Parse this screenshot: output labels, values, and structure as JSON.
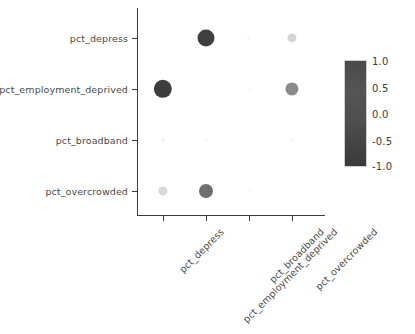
{
  "chart_data": {
    "type": "heatmap",
    "title": "",
    "xlabel": "",
    "ylabel": "",
    "grid": false,
    "legend_position": "right",
    "categories": [
      "pct_depress",
      "pct_employment_deprived",
      "pct_broadband",
      "pct_overcrowded"
    ],
    "x_tick_labels": [
      "pct_depress",
      "pct_employment_deprived",
      "pct_broadband",
      "pct_overcrowded"
    ],
    "y_tick_labels": [
      "pct_depress",
      "pct_employment_deprived",
      "pct_broadband",
      "pct_overcrowded"
    ],
    "colorbar": {
      "ticks": [
        "1.0",
        "0.5",
        "0.0",
        "-0.5",
        "-1.0"
      ],
      "vmin": -1.0,
      "vmax": 1.0,
      "top_color": "#4a4a4a",
      "bottom_color": "#3a3a3a"
    },
    "note": "Correlation matrix rendered as size+shade encoded dots; diagonal self-correlations not drawn.",
    "matrix": [
      {
        "row": "pct_depress",
        "cells": [
          {
            "col": "pct_depress",
            "value": null,
            "radius": 0.0,
            "color": "#ffffff"
          },
          {
            "col": "pct_employment_deprived",
            "value": 0.7,
            "radius": 8.5,
            "color": "#3f3f3f"
          },
          {
            "col": "pct_broadband",
            "value": 0.04,
            "radius": 1.6,
            "color": "#f4f4f4"
          },
          {
            "col": "pct_overcrowded",
            "value": 0.22,
            "radius": 4.6,
            "color": "#d5d5d5"
          }
        ]
      },
      {
        "row": "pct_employment_deprived",
        "cells": [
          {
            "col": "pct_depress",
            "value": 0.7,
            "radius": 9.2,
            "color": "#3d3d3d"
          },
          {
            "col": "pct_employment_deprived",
            "value": null,
            "radius": 0.0,
            "color": "#ffffff"
          },
          {
            "col": "pct_broadband",
            "value": 0.03,
            "radius": 1.3,
            "color": "#f7f7f7"
          },
          {
            "col": "pct_overcrowded",
            "value": 0.42,
            "radius": 6.6,
            "color": "#8a8a8a"
          }
        ]
      },
      {
        "row": "pct_broadband",
        "cells": [
          {
            "col": "pct_depress",
            "value": 0.04,
            "radius": 1.8,
            "color": "#f3f3f3"
          },
          {
            "col": "pct_employment_deprived",
            "value": 0.03,
            "radius": 1.6,
            "color": "#f5f5f5"
          },
          {
            "col": "pct_broadband",
            "value": null,
            "radius": 0.0,
            "color": "#ffffff"
          },
          {
            "col": "pct_overcrowded",
            "value": 0.03,
            "radius": 1.7,
            "color": "#f4f4f4"
          }
        ]
      },
      {
        "row": "pct_overcrowded",
        "cells": [
          {
            "col": "pct_depress",
            "value": 0.22,
            "radius": 4.6,
            "color": "#d8d8d8"
          },
          {
            "col": "pct_employment_deprived",
            "value": 0.42,
            "radius": 7.0,
            "color": "#6f6f6f"
          },
          {
            "col": "pct_broadband",
            "value": 0.03,
            "radius": 1.5,
            "color": "#f6f6f6"
          },
          {
            "col": "pct_overcrowded",
            "value": null,
            "radius": 0.0,
            "color": "#ffffff"
          }
        ]
      }
    ]
  }
}
